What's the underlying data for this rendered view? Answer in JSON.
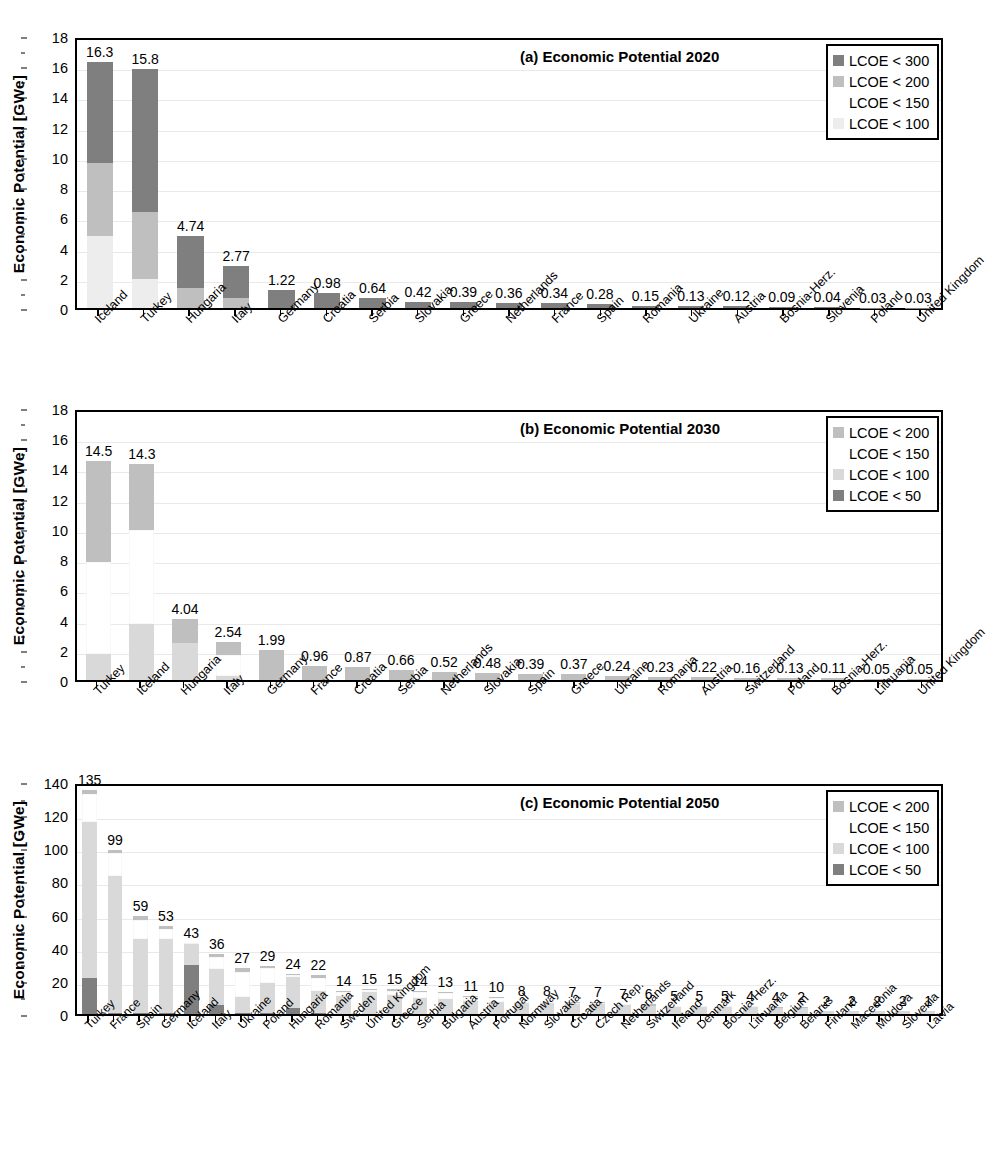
{
  "figure": {
    "ylabel": "Economic Potential [GWe]",
    "colors": {
      "lcoe_300": "#7f7f7f",
      "lcoe_200": "#bfbfbf",
      "lcoe_150": "#ffffff",
      "lcoe_100": "#ededed",
      "lcoe_50": "#7f7f7f",
      "grid": "#e9e9e9",
      "axis": "#000000"
    }
  },
  "chart_data": [
    {
      "type": "bar",
      "panel": "a",
      "panel_label": "(a)",
      "title": "Economic Potential 2020",
      "xlabel": "",
      "ylabel": "Economic Potential [GWe]",
      "ylim": [
        0,
        18
      ],
      "yticks": [
        0,
        2,
        4,
        6,
        8,
        10,
        12,
        14,
        16,
        18
      ],
      "grid": true,
      "stacked": true,
      "legend_position": "top-right",
      "legend": [
        "LCOE < 300",
        "LCOE < 200",
        "LCOE < 150",
        "LCOE < 100"
      ],
      "series": [
        {
          "name": "LCOE < 100",
          "color": "#ededed",
          "values": [
            4.75,
            1.9,
            0.0,
            0.0,
            0,
            0,
            0,
            0,
            0,
            0,
            0,
            0,
            0,
            0,
            0,
            0,
            0,
            0,
            0
          ]
        },
        {
          "name": "LCOE < 150",
          "color": "#ffffff",
          "values": [
            0.0,
            0.0,
            0.0,
            0.0,
            0,
            0,
            0,
            0,
            0,
            0,
            0,
            0,
            0,
            0,
            0,
            0,
            0,
            0,
            0
          ]
        },
        {
          "name": "LCOE < 200",
          "color": "#bfbfbf",
          "values": [
            4.85,
            4.45,
            1.3,
            0.65,
            0,
            0,
            0,
            0,
            0,
            0,
            0,
            0,
            0,
            0,
            0,
            0,
            0,
            0,
            0
          ]
        },
        {
          "name": "LCOE < 300",
          "color": "#7f7f7f",
          "values": [
            6.7,
            9.45,
            3.44,
            2.12,
            1.22,
            0.98,
            0.64,
            0.42,
            0.39,
            0.36,
            0.34,
            0.28,
            0.15,
            0.13,
            0.12,
            0.09,
            0.04,
            0.03,
            0.03
          ]
        }
      ],
      "categories": [
        "Iceland",
        "Turkey",
        "Hungaria",
        "Italy",
        "Germany",
        "Croatia",
        "Serbia",
        "Slovakia",
        "Greece",
        "Netherlands",
        "France",
        "Spain",
        "Romania",
        "Ukraine",
        "Austria",
        "Bosnia-Herz.",
        "Slovenia",
        "Poland",
        "United Kingdom"
      ],
      "totals": [
        "16.3",
        "15.8",
        "4.74",
        "2.77",
        "1.22",
        "0.98",
        "0.64",
        "0.42",
        "0.39",
        "0.36",
        "0.34",
        "0.28",
        "0.15",
        "0.13",
        "0.12",
        "0.09",
        "0.04",
        "0.03",
        "0.03"
      ]
    },
    {
      "type": "bar",
      "panel": "b",
      "panel_label": "(b)",
      "title": "Economic Potential 2030",
      "xlabel": "",
      "ylabel": "Economic Potential [GWe]",
      "ylim": [
        0,
        18
      ],
      "yticks": [
        0,
        2,
        4,
        6,
        8,
        10,
        12,
        14,
        16,
        18
      ],
      "grid": true,
      "stacked": true,
      "legend_position": "top-right",
      "legend": [
        "LCOE < 200",
        "LCOE < 150",
        "LCOE < 100",
        "LCOE < 50"
      ],
      "series": [
        {
          "name": "LCOE < 50",
          "color": "#7f7f7f",
          "values": [
            0,
            0,
            0,
            0,
            0,
            0,
            0,
            0,
            0,
            0,
            0,
            0,
            0,
            0,
            0,
            0,
            0,
            0,
            0,
            0
          ]
        },
        {
          "name": "LCOE < 100",
          "color": "#d9d9d9",
          "values": [
            1.7,
            3.7,
            2.45,
            0.25,
            0.0,
            0,
            0,
            0,
            0,
            0,
            0,
            0,
            0,
            0,
            0,
            0,
            0,
            0,
            0,
            0
          ]
        },
        {
          "name": "LCOE < 150",
          "color": "#ffffff",
          "values": [
            6.1,
            6.2,
            0.0,
            1.4,
            0.0,
            0,
            0,
            0,
            0,
            0,
            0,
            0,
            0,
            0,
            0,
            0,
            0,
            0,
            0,
            0
          ]
        },
        {
          "name": "LCOE < 200",
          "color": "#bfbfbf",
          "values": [
            6.7,
            4.4,
            1.59,
            0.89,
            1.99,
            0.96,
            0.87,
            0.66,
            0.52,
            0.48,
            0.39,
            0.37,
            0.24,
            0.23,
            0.22,
            0.16,
            0.13,
            0.11,
            0.05,
            0.05
          ]
        }
      ],
      "categories": [
        "Turkey",
        "Iceland",
        "Hungaria",
        "Italy",
        "Germany",
        "France",
        "Croatia",
        "Serbia",
        "Netherlands",
        "Slovakia",
        "Spain",
        "Greece",
        "Ukraine",
        "Romania",
        "Austria",
        "Switzerland",
        "Poland",
        "Bosnia-Herz.",
        "Lithuania",
        "United Kingdom"
      ],
      "totals": [
        "14.5",
        "14.3",
        "4.04",
        "2.54",
        "1.99",
        "0.96",
        "0.87",
        "0.66",
        "0.52",
        "0.48",
        "0.39",
        "0.37",
        "0.24",
        "0.23",
        "0.22",
        "0.16",
        "0.13",
        "0.11",
        "0.05",
        "0.05"
      ]
    },
    {
      "type": "bar",
      "panel": "c",
      "panel_label": "(c)",
      "title": "Economic Potential 2050",
      "xlabel": "",
      "ylabel": "Economic Potential [GWe]",
      "ylim": [
        0,
        140
      ],
      "yticks": [
        0,
        20,
        40,
        60,
        80,
        100,
        120,
        140
      ],
      "grid": true,
      "stacked": true,
      "legend_position": "top-right",
      "legend": [
        "LCOE < 200",
        "LCOE < 150",
        "LCOE < 100",
        "LCOE < 50"
      ],
      "series": [
        {
          "name": "LCOE < 50",
          "color": "#7f7f7f",
          "values": [
            22,
            0.5,
            0.5,
            0.5,
            29.5,
            5.5,
            0.5,
            0.5,
            3.5,
            0.5,
            0,
            0,
            0,
            0,
            0,
            0,
            0,
            0,
            0,
            0,
            0,
            0,
            0,
            0,
            0,
            0,
            0,
            0,
            0,
            0,
            0,
            0,
            0,
            0,
            0
          ]
        },
        {
          "name": "LCOE < 100",
          "color": "#d9d9d9",
          "values": [
            94,
            82.5,
            45,
            44.5,
            13,
            21.5,
            9.5,
            18.5,
            19,
            13.5,
            11,
            13.5,
            11.5,
            9.5,
            9,
            8,
            7.5,
            6.5,
            6.5,
            6,
            6,
            5.5,
            5,
            4.5,
            4.5,
            4,
            4,
            3.5,
            3.5,
            1.8,
            1.8,
            1.8,
            1.8,
            1.8,
            0.9
          ]
        },
        {
          "name": "LCOE < 150",
          "color": "#ffffff",
          "values": [
            17,
            14,
            11.5,
            6.5,
            0.5,
            7.5,
            15.5,
            8.5,
            1,
            7.5,
            2.5,
            1,
            2.5,
            3.5,
            3.5,
            2.5,
            2.2,
            1.2,
            1.2,
            0.8,
            0.8,
            0.3,
            0.1,
            0.3,
            0.3,
            0.8,
            0.8,
            0.4,
            0.4,
            0.1,
            0.1,
            0.1,
            0.1,
            0.1,
            0.05
          ]
        },
        {
          "name": "LCOE < 200",
          "color": "#bfbfbf",
          "values": [
            2,
            2,
            2,
            1.5,
            0,
            1.5,
            2,
            1.5,
            0.5,
            2,
            0.5,
            0.5,
            1,
            1,
            0.5,
            0.5,
            0.3,
            0.3,
            0.3,
            0.2,
            0.2,
            0.2,
            0.9,
            0.2,
            0.2,
            0.2,
            0.2,
            0.1,
            0.1,
            0.1,
            0.1,
            0.1,
            0.1,
            0.1,
            0.05
          ]
        }
      ],
      "categories": [
        "Turkey",
        "France",
        "Spain",
        "Germany",
        "Iceland",
        "Italy",
        "Ukraine",
        "Poland",
        "Hungaria",
        "Romania",
        "Sweden",
        "United Kingdom",
        "Greece",
        "Serbia",
        "Bulgaria",
        "Austria",
        "Portugal",
        "Normway",
        "Slovakia",
        "Croatia",
        "Czech Rep.",
        "Netherlands",
        "Switzerland",
        "Ireland",
        "Denmark",
        "Bosnia-Herz.",
        "Lithuania",
        "Belgium",
        "Belarus",
        "Finland",
        "Macedonia",
        "Moldova",
        "Slovenia",
        "Latvia"
      ],
      "totals": [
        "135",
        "99",
        "59",
        "53",
        "43",
        "36",
        "27",
        "29",
        "24",
        "22",
        "14",
        "15",
        "15",
        "14",
        "13",
        "11",
        "10",
        "8",
        "8",
        "7",
        "7",
        "7",
        "6",
        "5",
        "5",
        "5",
        "4",
        "4",
        "2",
        "2",
        "2",
        "2",
        "2",
        "1"
      ]
    }
  ]
}
